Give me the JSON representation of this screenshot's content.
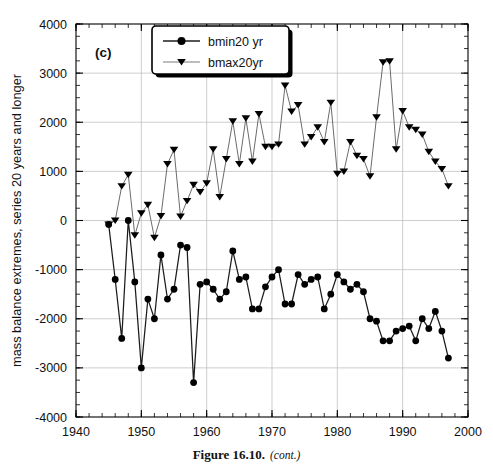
{
  "figure": {
    "caption_main": "Figure 16.10.",
    "caption_cont": "(cont.)",
    "panel_label": "(c)"
  },
  "chart_data": {
    "type": "line",
    "title": "",
    "subtitle": "",
    "xlabel": "",
    "ylabel": "mass balance extremes, series 20 years and longer",
    "xlim": [
      1940,
      2000
    ],
    "ylim": [
      -4000,
      4000
    ],
    "xticks": [
      1940,
      1950,
      1960,
      1970,
      1980,
      1990,
      2000
    ],
    "xtick_labels": [
      "1940",
      "1950",
      "1960",
      "1970",
      "1980",
      "1990",
      "2000"
    ],
    "yticks": [
      -4000,
      -3000,
      -2000,
      -1000,
      0,
      1000,
      2000,
      3000,
      4000
    ],
    "ytick_labels": [
      "-4000",
      "-3000",
      "-2000",
      "-1000",
      "0",
      "1000",
      "2000",
      "3000",
      "4000"
    ],
    "x_minor_tick_interval": 2,
    "y_minor_tick_interval": 250,
    "grid": true,
    "grid_axis": "both",
    "legend_position": "top-center",
    "legend": [
      "bmin20 yr",
      "bmax20yr"
    ],
    "series": [
      {
        "name": "bmin20 yr",
        "marker": "circle",
        "x": [
          1945,
          1946,
          1947,
          1948,
          1949,
          1950,
          1951,
          1952,
          1953,
          1954,
          1955,
          1956,
          1957,
          1958,
          1959,
          1960,
          1961,
          1962,
          1963,
          1964,
          1965,
          1966,
          1967,
          1968,
          1969,
          1970,
          1971,
          1972,
          1973,
          1974,
          1975,
          1976,
          1977,
          1978,
          1979,
          1980,
          1981,
          1982,
          1983,
          1984,
          1985,
          1986,
          1987,
          1988,
          1989,
          1990,
          1991,
          1992,
          1993,
          1994,
          1995,
          1996,
          1997
        ],
        "values": [
          -80,
          -1200,
          -2400,
          0,
          -1250,
          -3000,
          -1600,
          -2000,
          -700,
          -1600,
          -1400,
          -500,
          -550,
          -3300,
          -1300,
          -1250,
          -1400,
          -1600,
          -1450,
          -620,
          -1200,
          -1150,
          -1800,
          -1800,
          -1350,
          -1150,
          -1000,
          -1700,
          -1700,
          -1100,
          -1300,
          -1200,
          -1150,
          -1800,
          -1500,
          -1100,
          -1250,
          -1400,
          -1300,
          -1450,
          -2000,
          -2050,
          -2450,
          -2450,
          -2250,
          -2200,
          -2150,
          -2450,
          -2000,
          -2200,
          -1850,
          -2250,
          -2800
        ]
      },
      {
        "name": "bmax20yr",
        "marker": "triangle-down",
        "x": [
          1945,
          1946,
          1947,
          1948,
          1949,
          1950,
          1951,
          1952,
          1953,
          1954,
          1955,
          1956,
          1957,
          1958,
          1959,
          1960,
          1961,
          1962,
          1963,
          1964,
          1965,
          1966,
          1967,
          1968,
          1969,
          1970,
          1971,
          1972,
          1973,
          1974,
          1975,
          1976,
          1977,
          1978,
          1979,
          1980,
          1981,
          1982,
          1983,
          1984,
          1985,
          1986,
          1987,
          1988,
          1989,
          1990,
          1991,
          1992,
          1993,
          1994,
          1995,
          1996,
          1997
        ],
        "values": [
          -80,
          0,
          700,
          930,
          -300,
          150,
          320,
          -350,
          90,
          1150,
          1440,
          80,
          400,
          730,
          580,
          760,
          1450,
          480,
          1250,
          2020,
          1150,
          2080,
          1200,
          2170,
          1500,
          1500,
          1550,
          2750,
          2220,
          2350,
          1550,
          1700,
          1900,
          1600,
          2400,
          950,
          1000,
          1600,
          1320,
          1250,
          900,
          2100,
          3220,
          3240,
          1450,
          2230,
          1900,
          1850,
          1750,
          1400,
          1200,
          1050,
          700
        ]
      }
    ]
  }
}
